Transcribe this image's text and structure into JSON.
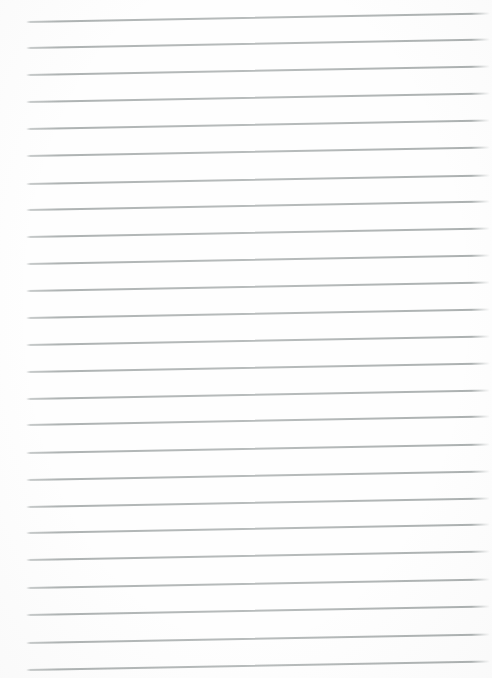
{
  "page": {
    "width_px": 492,
    "height_px": 678,
    "background_color": "#fefefe",
    "text_content": ""
  },
  "ruling": {
    "rule_color": "#9aa0a0",
    "rule_count": 25,
    "rule_thickness_px": 1.5,
    "rule_start_x_px": 26,
    "rule_end_x_px": 490,
    "rule_tilt_deg": -1.05,
    "rule_spacing_px": 27
  },
  "rules": [
    {
      "y": 20.7
    },
    {
      "y": 47.3
    },
    {
      "y": 74.3
    },
    {
      "y": 101.0
    },
    {
      "y": 128.0
    },
    {
      "y": 155.0
    },
    {
      "y": 182.5
    },
    {
      "y": 209.3
    },
    {
      "y": 236.0
    },
    {
      "y": 263.3
    },
    {
      "y": 290.3
    },
    {
      "y": 317.2
    },
    {
      "y": 344.0
    },
    {
      "y": 370.8
    },
    {
      "y": 397.5
    },
    {
      "y": 424.3
    },
    {
      "y": 451.7
    },
    {
      "y": 479.0
    },
    {
      "y": 505.5
    },
    {
      "y": 532.2
    },
    {
      "y": 559.3
    },
    {
      "y": 586.7
    },
    {
      "y": 614.2
    },
    {
      "y": 641.5
    },
    {
      "y": 668.8
    }
  ]
}
